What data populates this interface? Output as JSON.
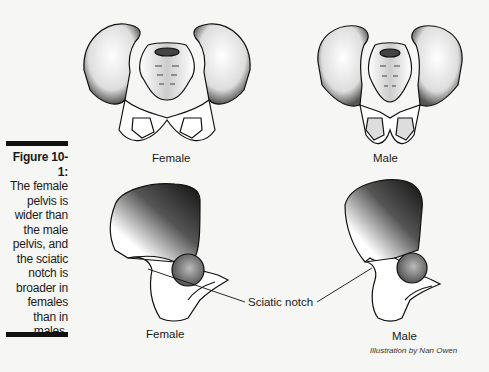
{
  "figure": {
    "number": "Figure 10-1:",
    "caption_lines": [
      "The female",
      "pelvis is",
      "wider than",
      "the male",
      "pelvis, and",
      "the sciatic",
      "notch is",
      "broader in",
      "females",
      "than in",
      "males."
    ],
    "top_labels": {
      "left": "Female",
      "right": "Male"
    },
    "bottom_labels": {
      "left": "Female",
      "right": "Male"
    },
    "callout": "Sciatic notch",
    "credit": "Illustration by Nan Owen"
  },
  "colors": {
    "ink": "#111111",
    "paper": "#f6f6f4",
    "shade": "#3a3a3a"
  }
}
